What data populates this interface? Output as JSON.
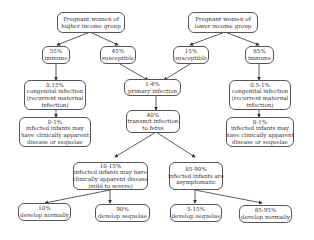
{
  "diagram": {
    "nodes": {
      "higher": {
        "lines": [
          "Pregnant women of",
          "higher income group"
        ]
      },
      "lower": {
        "lines": [
          "Pregnant women of",
          "lower income group"
        ]
      },
      "h_immune": {
        "lines": [
          "55%",
          "immune"
        ]
      },
      "h_susceptible": {
        "lines": [
          "45%",
          "susceptible"
        ]
      },
      "l_susceptible": {
        "lines": [
          "15%",
          "susceptible"
        ]
      },
      "l_immune": {
        "lines": [
          "85%",
          "immune"
        ]
      },
      "h_congenital": {
        "lines": [
          "0.15%",
          "congenital infection",
          "(recurrent maternal",
          "infection)"
        ]
      },
      "l_congenital": {
        "lines": [
          "0.5-1%",
          "congenital infection",
          "(recurrent maternal",
          "infection)"
        ]
      },
      "h_infected": {
        "lines": [
          "0-1%",
          "infected infants may",
          "have clinically apparent",
          "disease or sequelae"
        ]
      },
      "l_infected": {
        "lines": [
          "0-1%",
          "infected infants may",
          "have clinically apparent",
          "disease or sequelae"
        ]
      },
      "primary": {
        "lines": [
          "1-4%",
          "primary infection"
        ]
      },
      "transmit": {
        "lines": [
          "40%",
          "transmit infection",
          "to fetus"
        ]
      },
      "apparent": {
        "lines": [
          "10-15%",
          "infected infants may have",
          "clinically apparent disease",
          "(mild to severe)"
        ]
      },
      "asymptomatic": {
        "lines": [
          "85-90%",
          "infected infants are",
          "asymptomatic"
        ]
      },
      "a_normal": {
        "lines": [
          "10%",
          "develop normally"
        ]
      },
      "a_sequelae": {
        "lines": [
          "90%",
          "develop sequelae"
        ]
      },
      "s_sequelae": {
        "lines": [
          "5-15%",
          "develop sequelae"
        ]
      },
      "s_normal": {
        "lines": [
          "85-95%",
          "develop normally"
        ]
      }
    }
  }
}
